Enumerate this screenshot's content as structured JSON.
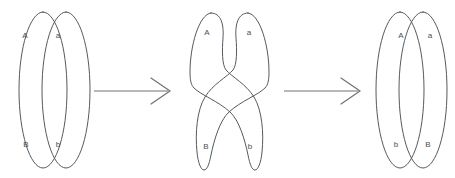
{
  "figure": {
    "background_color": "#ffffff",
    "line_color": "#555a5e",
    "arrow_color": "#6d7276",
    "label_color": "#4a4f53",
    "width": 455,
    "height": 178
  },
  "stages": [
    {
      "id": "stage-1",
      "name": "paired-chromatids",
      "caption": "",
      "labels": {
        "top_left": "A",
        "top_right": "a",
        "bottom_left": "B",
        "bottom_right": "b"
      }
    },
    {
      "id": "stage-2",
      "name": "chiasma-crossing",
      "caption": "",
      "labels": {
        "top_left": "A",
        "top_right": "a",
        "bottom_left": "B",
        "bottom_right": "b"
      }
    },
    {
      "id": "stage-3",
      "name": "recombined-chromatids",
      "caption": "",
      "labels": {
        "top_left": "A",
        "top_right": "a",
        "bottom_left": "b",
        "bottom_right": "B"
      }
    }
  ],
  "arrows": [
    {
      "id": "arrow-1",
      "name": "stage-1-to-stage-2",
      "label": ""
    },
    {
      "id": "arrow-2",
      "name": "stage-2-to-stage-3",
      "label": ""
    }
  ]
}
